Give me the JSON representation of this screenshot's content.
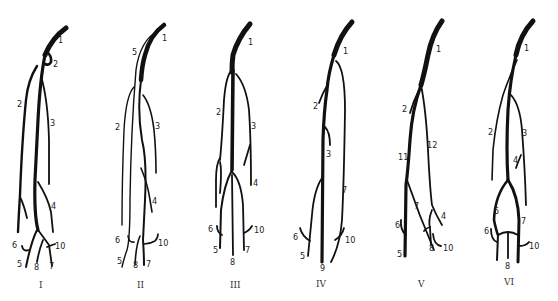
{
  "diagram": {
    "type": "anatomical vessel branching variants",
    "panels": [
      {
        "id": "I",
        "roman": "I",
        "labels": [
          "1",
          "2",
          "2",
          "3",
          "4",
          "5",
          "6",
          "7",
          "8",
          "10"
        ]
      },
      {
        "id": "II",
        "roman": "II",
        "labels": [
          "1",
          "5",
          "2",
          "3",
          "4",
          "5",
          "6",
          "7",
          "8",
          "10"
        ]
      },
      {
        "id": "III",
        "roman": "III",
        "labels": [
          "1",
          "2",
          "3",
          "4",
          "5",
          "6",
          "7",
          "8",
          "10"
        ]
      },
      {
        "id": "IV",
        "roman": "IV",
        "labels": [
          "1",
          "2",
          "3",
          "7",
          "5",
          "6",
          "9",
          "10"
        ]
      },
      {
        "id": "V",
        "roman": "V",
        "labels": [
          "1",
          "2",
          "11",
          "12",
          "7",
          "4",
          "6",
          "5",
          "8",
          "10"
        ]
      },
      {
        "id": "VI",
        "roman": "VI",
        "labels": [
          "1",
          "2",
          "3",
          "4",
          "5",
          "7",
          "6",
          "8",
          "10"
        ]
      }
    ]
  },
  "p1": {
    "l1": "1",
    "l2a": "2",
    "l2b": "2",
    "l3": "3",
    "l4": "4",
    "l5": "5",
    "l6": "6",
    "l7": "7",
    "l8": "8",
    "l10": "10",
    "roman": "I"
  },
  "p2": {
    "l1": "1",
    "l5a": "5",
    "l2": "2",
    "l3": "3",
    "l4": "4",
    "l5": "5",
    "l6": "6",
    "l7": "7",
    "l8": "8",
    "l10": "10",
    "roman": "II"
  },
  "p3": {
    "l1": "1",
    "l2": "2",
    "l3": "3",
    "l4": "4",
    "l5": "5",
    "l6": "6",
    "l7": "7",
    "l8": "8",
    "l10": "10",
    "roman": "III"
  },
  "p4": {
    "l1": "1",
    "l2": "2",
    "l3": "3",
    "l7": "7",
    "l5": "5",
    "l6": "6",
    "l9": "9",
    "l10": "10",
    "roman": "IV"
  },
  "p5": {
    "l1": "1",
    "l2": "2",
    "l11": "11",
    "l12": "12",
    "l7": "7",
    "l4": "4",
    "l6": "6",
    "l5": "5",
    "l8": "8",
    "l10": "10",
    "roman": "V"
  },
  "p6": {
    "l1": "1",
    "l2": "2",
    "l3": "3",
    "l4": "4",
    "l5": "5",
    "l7": "7",
    "l6": "6",
    "l8": "8",
    "l10": "10",
    "roman": "VI"
  }
}
